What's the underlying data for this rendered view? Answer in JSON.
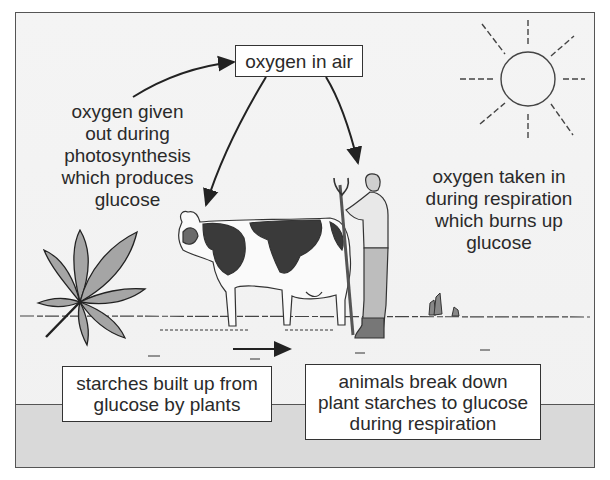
{
  "diagram": {
    "title_box": {
      "text": "oxygen in air"
    },
    "left_label": {
      "lines": [
        "oxygen given",
        "out during",
        "photosynthesis",
        "which produces",
        "glucose"
      ]
    },
    "right_label": {
      "lines": [
        "oxygen taken in",
        "during respiration",
        "which burns up",
        "glucose"
      ]
    },
    "bottom_left_box": {
      "lines": [
        "starches built up from",
        "glucose by plants"
      ]
    },
    "bottom_right_box": {
      "lines": [
        "animals break down",
        "plant starches to glucose",
        "during respiration"
      ]
    },
    "illustrations": {
      "sun": "sun-icon",
      "plant": "leaf-icon",
      "cow": "cow-illustration",
      "farmer": "farmer-illustration"
    },
    "colors": {
      "background": "#f3f3f3",
      "ground_band": "#d9d9d9",
      "ink": "#2a2a2a",
      "cow_patch": "#3a3a3a",
      "leaf": "#9a9a9a"
    }
  }
}
